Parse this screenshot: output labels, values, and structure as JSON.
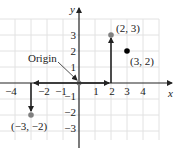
{
  "diagram": {
    "type": "cartesian-coordinate-plane",
    "axes": {
      "x_label": "x",
      "y_label": "y"
    },
    "x_ticks": [
      {
        "value": -4,
        "label": "−4"
      },
      {
        "value": -2,
        "label": "−2"
      },
      {
        "value": -1,
        "label": "−1"
      },
      {
        "value": 1,
        "label": "1"
      },
      {
        "value": 2,
        "label": "2"
      },
      {
        "value": 3,
        "label": "3"
      },
      {
        "value": 4,
        "label": "4"
      }
    ],
    "y_ticks": [
      {
        "value": 3,
        "label": "3"
      },
      {
        "value": 2,
        "label": "2"
      },
      {
        "value": 1,
        "label": "1"
      },
      {
        "value": -1,
        "label": "−1"
      },
      {
        "value": -2,
        "label": "−2"
      },
      {
        "value": -3,
        "label": "−3"
      }
    ],
    "origin_label": "Origin",
    "points": [
      {
        "x": 2,
        "y": 3,
        "label": "(2, 3)",
        "color": "#808080"
      },
      {
        "x": 3,
        "y": 2,
        "label": "(3, 2)",
        "color": "#000000"
      },
      {
        "x": -3,
        "y": -2,
        "label": "(−3, −2)",
        "color": "#808080"
      }
    ],
    "colors": {
      "grid": "#e2e2e2",
      "axis": "#222222",
      "arrow": "#222222"
    }
  }
}
